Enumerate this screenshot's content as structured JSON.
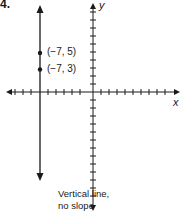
{
  "problem": {
    "number": "4."
  },
  "graph": {
    "x_axis_label": "x",
    "y_axis_label": "y",
    "points": [
      {
        "label": "(−7, 5)",
        "x": -7,
        "y": 5
      },
      {
        "label": "(−7, 3)",
        "x": -7,
        "y": 3
      }
    ],
    "line": {
      "type": "vertical",
      "x": -7
    }
  },
  "caption": {
    "line1": "Vertical line,",
    "line2": "no slope"
  },
  "colors": {
    "ink": "#1a1a1a",
    "background": "#ffffff"
  }
}
